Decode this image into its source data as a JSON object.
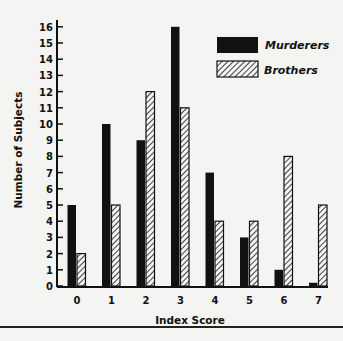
{
  "chart_data": {
    "type": "bar",
    "title": "",
    "xlabel": "Index Score",
    "ylabel": "Number of Subjects",
    "categories": [
      "0",
      "1",
      "2",
      "3",
      "4",
      "5",
      "6",
      "7"
    ],
    "series": [
      {
        "name": "Murderers",
        "style": "solid",
        "color": "#111111",
        "values": [
          5,
          10,
          9,
          16,
          7,
          3,
          1,
          0.2
        ]
      },
      {
        "name": "Brothers",
        "style": "hatched",
        "color": "#111111",
        "values": [
          2,
          5,
          12,
          11,
          4,
          4,
          8,
          5
        ]
      }
    ],
    "yticks": [
      0,
      1,
      2,
      3,
      4,
      5,
      6,
      7,
      8,
      9,
      10,
      11,
      12,
      13,
      14,
      15,
      16
    ],
    "ylim": [
      0,
      16
    ],
    "grid": false,
    "legend_position": "upper right"
  }
}
